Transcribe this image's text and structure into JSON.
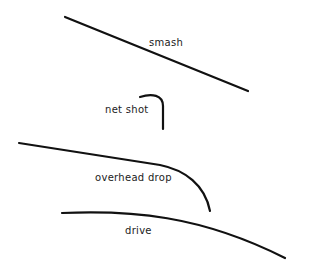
{
  "diagram": {
    "title": "",
    "background": "#ffffff",
    "stroke_color": "#111111",
    "trajectories": [
      {
        "name": "smash",
        "label": "smash",
        "path": "M65 17 L248 91",
        "label_pos": {
          "x": 149,
          "y": 37
        }
      },
      {
        "name": "net-shot",
        "label": "net shot",
        "path": "M140 97 C152 93 163 95 163 106 L163 129",
        "label_pos": {
          "x": 105,
          "y": 104
        }
      },
      {
        "name": "overhead-drop",
        "label": "overhead drop",
        "path": "M19 143 L160 165 C185 170 205 185 210 211",
        "label_pos": {
          "x": 95,
          "y": 172
        }
      },
      {
        "name": "drive",
        "label": "drive",
        "path": "M62 213 C130 210 200 215 285 258",
        "label_pos": {
          "x": 125,
          "y": 225
        }
      }
    ]
  }
}
